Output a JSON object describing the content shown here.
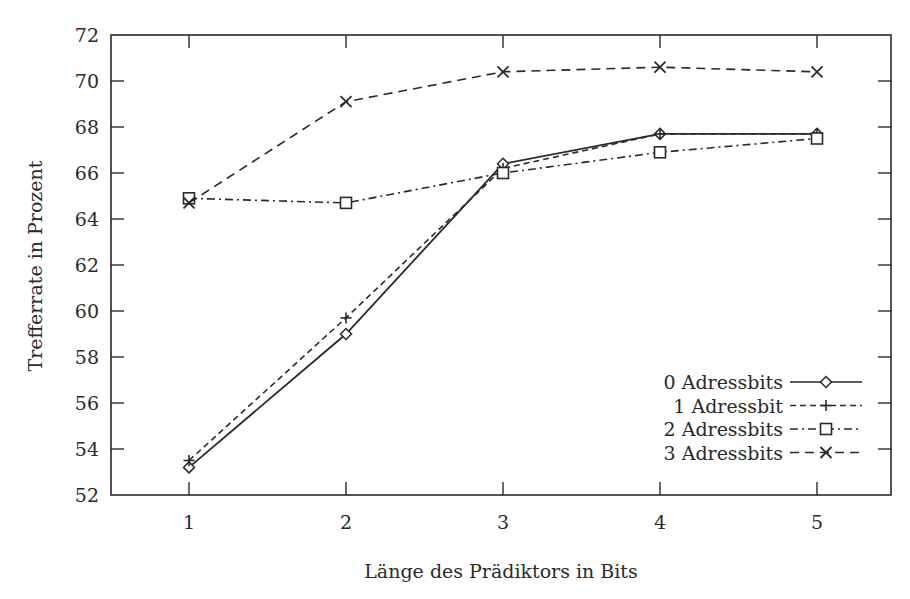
{
  "chart_data": {
    "type": "line",
    "title": "",
    "xlabel": "Länge des Prädiktors in Bits",
    "ylabel": "Trefferrate in Prozent",
    "x": [
      1,
      2,
      3,
      4,
      5
    ],
    "x_tick_labels": [
      "1",
      "2",
      "3",
      "4",
      "5"
    ],
    "y_tick_labels": [
      "52",
      "54",
      "56",
      "58",
      "60",
      "62",
      "64",
      "66",
      "68",
      "70",
      "72"
    ],
    "xlim": [
      0.5,
      5.5
    ],
    "ylim": [
      52,
      72
    ],
    "grid": false,
    "legend_position": "lower right",
    "series": [
      {
        "name": "0 Adressbits",
        "values": [
          53.2,
          59.0,
          66.4,
          67.7,
          67.7
        ],
        "line_style": "solid",
        "marker": "diamond"
      },
      {
        "name": "1 Adressbit",
        "values": [
          53.5,
          59.7,
          66.2,
          67.7,
          67.7
        ],
        "line_style": "dashed",
        "marker": "plus"
      },
      {
        "name": "2 Adressbits",
        "values": [
          64.9,
          64.7,
          66.0,
          66.9,
          67.5
        ],
        "line_style": "dash-dot",
        "marker": "square"
      },
      {
        "name": "3 Adressbits",
        "values": [
          64.7,
          69.1,
          70.4,
          70.6,
          70.4
        ],
        "line_style": "long-dashed",
        "marker": "cross"
      }
    ]
  },
  "colors": {
    "line": "#2a2a2a",
    "background": "#ffffff"
  }
}
